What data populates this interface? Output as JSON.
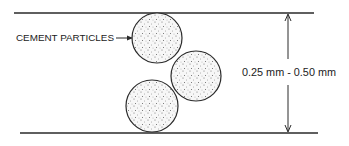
{
  "diagram": {
    "colors": {
      "line": "#2a2a2a",
      "particle_fill": "#f4f4f4",
      "stipple": "#555555"
    },
    "labels": {
      "particles": "CEMENT PARTICLES",
      "gap_size": "0.25 mm - 0.50 mm"
    },
    "boundaries": {
      "top": {
        "y": 13,
        "x1": 14,
        "x2": 314
      },
      "bottom": {
        "y": 133,
        "x1": 20,
        "x2": 318
      }
    },
    "particles": [
      {
        "cx": 157,
        "cy": 38,
        "r": 25
      },
      {
        "cx": 196,
        "cy": 76,
        "r": 25
      },
      {
        "cx": 152,
        "cy": 106,
        "r": 26
      }
    ],
    "dimension_arrow": {
      "x": 288,
      "y_top": 13,
      "y_bottom": 133
    }
  }
}
